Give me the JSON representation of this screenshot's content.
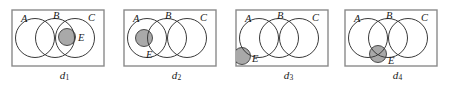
{
  "figure": {
    "type": "venn-diagram-series",
    "panel_count": 4,
    "colors": {
      "background": "#ffffff",
      "stroke": "#3a3a3a",
      "box_stroke": "#8a8a8a",
      "shade_fill": "#a9a9a9",
      "label_color": "#1a1a1a"
    },
    "geometry": {
      "box": {
        "x": 4,
        "y": 10,
        "width": 92,
        "height": 56
      },
      "circle_radius": 19.5,
      "circle_cy": 38,
      "circle_a_cx": 27,
      "circle_b_cx": 47,
      "circle_c_cx": 67,
      "small_radius": 8.5
    },
    "panels": [
      {
        "id": "panel-d1",
        "caption": "d",
        "caption_sub": "1",
        "x": 8,
        "labels": [
          {
            "name": "A",
            "text": "A",
            "x": 13,
            "y": 22
          },
          {
            "name": "B",
            "text": "B",
            "x": 45,
            "y": 19
          },
          {
            "name": "C",
            "text": "C",
            "x": 80,
            "y": 21
          },
          {
            "name": "E",
            "text": "E",
            "x": 70,
            "y": 41
          }
        ],
        "shaded": {
          "cx": 59,
          "cy": 37,
          "r": 8.5,
          "clipped": false
        },
        "e_position": "straddles B and C boundary, inside B∩C region"
      },
      {
        "id": "panel-d2",
        "caption": "d",
        "caption_sub": "2",
        "x": 120,
        "labels": [
          {
            "name": "A",
            "text": "A",
            "x": 13,
            "y": 22
          },
          {
            "name": "B",
            "text": "B",
            "x": 45,
            "y": 19
          },
          {
            "name": "C",
            "text": "C",
            "x": 80,
            "y": 21
          },
          {
            "name": "E",
            "text": "E",
            "x": 26,
            "y": 58
          }
        ],
        "shaded": {
          "cx": 24,
          "cy": 38,
          "r": 8.5,
          "clipped": false
        },
        "e_position": "entirely inside circle A"
      },
      {
        "id": "panel-d3",
        "caption": "d",
        "caption_sub": "3",
        "x": 232,
        "labels": [
          {
            "name": "A",
            "text": "A",
            "x": 13,
            "y": 22
          },
          {
            "name": "B",
            "text": "B",
            "x": 45,
            "y": 19
          },
          {
            "name": "C",
            "text": "C",
            "x": 80,
            "y": 21
          },
          {
            "name": "E",
            "text": "E",
            "x": 20,
            "y": 62
          }
        ],
        "shaded": {
          "cx": 10,
          "cy": 56,
          "r": 8.5,
          "clipped": true
        },
        "e_position": "outside all circles, bottom-left corner of box"
      },
      {
        "id": "panel-d4",
        "caption": "d",
        "caption_sub": "4",
        "x": 341,
        "labels": [
          {
            "name": "A",
            "text": "A",
            "x": 13,
            "y": 22
          },
          {
            "name": "B",
            "text": "B",
            "x": 45,
            "y": 19
          },
          {
            "name": "C",
            "text": "C",
            "x": 80,
            "y": 21
          },
          {
            "name": "E",
            "text": "E",
            "x": 47,
            "y": 64
          }
        ],
        "shaded": {
          "cx": 37,
          "cy": 54,
          "r": 8.5,
          "clipped": false
        },
        "e_position": "centred on lower crossing point of circles A and B"
      }
    ]
  }
}
